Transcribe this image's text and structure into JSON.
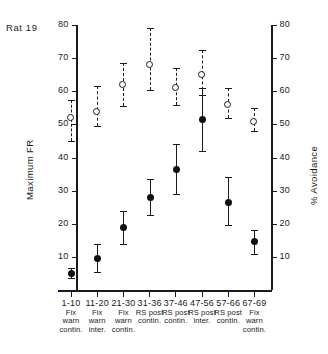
{
  "figure": {
    "subject_label": "Rat 19",
    "left_axis_title": "Maximum FR",
    "right_axis_title": "% Avoidance"
  },
  "chart_data": {
    "type": "scatter",
    "title": "Rat 19",
    "xlabel": "",
    "ylabel": "Maximum FR",
    "y2label": "% Avoidance",
    "ylim": [
      0,
      80
    ],
    "y2lim": [
      0,
      80
    ],
    "yticks": [
      10,
      20,
      30,
      40,
      50,
      60,
      70,
      80
    ],
    "y2ticks": [
      10,
      20,
      30,
      40,
      50,
      60,
      70,
      80
    ],
    "grid": false,
    "legend": "none",
    "categories": [
      "1-10",
      "11-20",
      "21-30",
      "31-36",
      "37-46",
      "47-56",
      "57-66",
      "67-69"
    ],
    "category_sublabels": [
      [
        "Fix",
        "warn",
        "contin."
      ],
      [
        "Fix",
        "warn",
        "inter."
      ],
      [
        "Fix",
        "warn",
        "contin."
      ],
      [
        "RS post",
        "contin."
      ],
      [
        "RS post",
        "contin."
      ],
      [
        "RS post",
        "inter."
      ],
      [
        "RS post",
        "contin."
      ],
      [
        "Fix",
        "warn",
        "contin."
      ]
    ],
    "series": [
      {
        "name": "Maximum FR",
        "marker": "filled-circle",
        "line": "solid",
        "axis": "left",
        "values": [
          5,
          9.5,
          19,
          28,
          36.5,
          51.5,
          26.5,
          14.5
        ],
        "err_low": [
          3.5,
          5.5,
          14,
          22.5,
          29,
          42,
          19.5,
          11
        ],
        "err_high": [
          6.5,
          14,
          24,
          33.5,
          44,
          61,
          34,
          18
        ]
      },
      {
        "name": "% Avoidance",
        "marker": "open-circle",
        "line": "dashed",
        "axis": "right",
        "values": [
          52,
          54,
          62,
          68,
          61,
          65,
          56,
          51
        ],
        "err_low": [
          45,
          49.5,
          55.5,
          60.5,
          56,
          59,
          52,
          48
        ],
        "err_high": [
          57.5,
          61.5,
          68.5,
          79,
          67,
          72.5,
          61,
          55
        ]
      }
    ]
  }
}
